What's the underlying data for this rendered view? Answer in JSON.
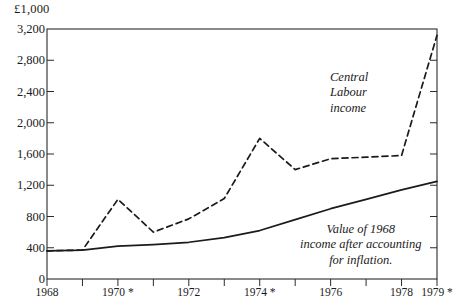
{
  "chart_data": {
    "type": "line",
    "title": "",
    "unit_label": "£1,000",
    "xlabel": "",
    "ylabel": "",
    "xlim": [
      1968,
      1979
    ],
    "ylim": [
      0,
      3200
    ],
    "grid": false,
    "legend_position": "inline-annotation",
    "y_ticks": [
      "0",
      "400",
      "800",
      "1,200",
      "1,600",
      "2,000",
      "2,400",
      "2,800",
      "3,200"
    ],
    "y_tick_values": [
      0,
      400,
      800,
      1200,
      1600,
      2000,
      2400,
      2800,
      3200
    ],
    "x_ticks": [
      "1968",
      "1970 *",
      "1972",
      "1974 *",
      "1976",
      "1978",
      "1979 *"
    ],
    "x_tick_values": [
      1968,
      1970,
      1972,
      1974,
      1976,
      1978,
      1979
    ],
    "x": [
      1968,
      1969,
      1970,
      1971,
      1972,
      1973,
      1974,
      1975,
      1976,
      1977,
      1978,
      1979
    ],
    "series": [
      {
        "name": "Central Labour income",
        "style": "dashed",
        "color": "#1b1b1b",
        "values": [
          360,
          370,
          1020,
          600,
          770,
          1030,
          1800,
          1400,
          1540,
          1560,
          1580,
          3120
        ]
      },
      {
        "name": "Value of 1968 income after accounting for inflation.",
        "style": "solid",
        "color": "#1b1b1b",
        "values": [
          360,
          370,
          420,
          440,
          470,
          530,
          620,
          760,
          900,
          1020,
          1140,
          1250
        ]
      }
    ],
    "annotations": [
      {
        "id": "central",
        "text": "Central\nLabour\nincome"
      },
      {
        "id": "real",
        "text": "Value of 1968\nincome after accounting\nfor inflation."
      }
    ]
  }
}
